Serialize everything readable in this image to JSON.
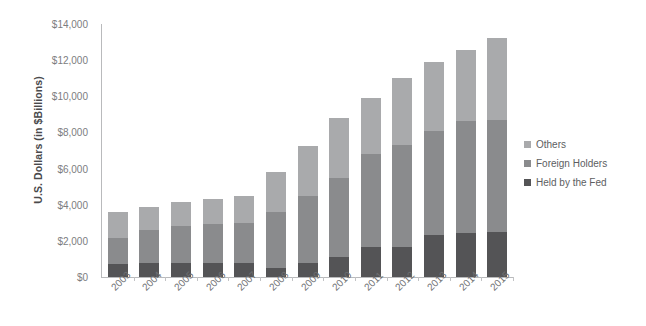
{
  "chart_data": {
    "type": "bar",
    "subtype": "stacked-column",
    "title": "",
    "xlabel": "",
    "ylabel": "U.S. Dollars (in $Billions)",
    "ylim": [
      0,
      14000
    ],
    "ytick_step": 2000,
    "ytick_labels": [
      "$0",
      "$2,000",
      "$4,000",
      "$6,000",
      "$8,000",
      "$10,000",
      "$12,000",
      "$14,000"
    ],
    "ytick_values": [
      0,
      2000,
      4000,
      6000,
      8000,
      10000,
      12000,
      14000
    ],
    "grid": false,
    "legend_position": "right",
    "categories": [
      "2003",
      "2004",
      "2005",
      "2006",
      "2007",
      "2008",
      "2009",
      "2010",
      "2011",
      "2012",
      "2013",
      "2014",
      "2015"
    ],
    "series": [
      {
        "name": "Held by the Fed",
        "color": "#545456",
        "values": [
          700,
          750,
          750,
          780,
          750,
          480,
          770,
          1100,
          1650,
          1650,
          2350,
          2450,
          2500
        ]
      },
      {
        "name": "Foreign Holders",
        "color": "#8a8b8d",
        "values": [
          1450,
          1850,
          2050,
          2170,
          2250,
          3120,
          3730,
          4400,
          5150,
          5650,
          5750,
          6200,
          6200
        ]
      },
      {
        "name": "Others",
        "color": "#a9aaac",
        "values": [
          1450,
          1300,
          1350,
          1350,
          1500,
          2200,
          2750,
          3300,
          3100,
          3700,
          3800,
          3900,
          4500
        ]
      }
    ],
    "totals": [
      3600,
      3900,
      4150,
      4300,
      4500,
      5800,
      7250,
      8800,
      9900,
      11000,
      11900,
      12550,
      13200
    ]
  },
  "legend": {
    "items": [
      {
        "label": "Others",
        "color": "#a9aaac"
      },
      {
        "label": "Foreign Holders",
        "color": "#8a8b8d"
      },
      {
        "label": "Held by the Fed",
        "color": "#545456"
      }
    ]
  },
  "axes": {
    "y_title": "U.S. Dollars (in $Billions)"
  }
}
